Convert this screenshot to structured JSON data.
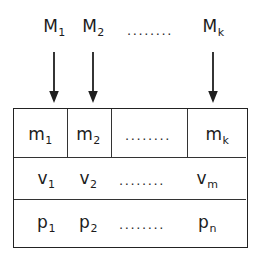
{
  "figure": {
    "type": "block-diagram",
    "background_color": "#ffffff",
    "line_color": "#222222",
    "text_color": "#1c1c1c",
    "ellipsis_text": "........"
  },
  "sources": {
    "items": [
      {
        "base": "M",
        "sub": "1",
        "x": 54
      },
      {
        "base": "M",
        "sub": "2",
        "x": 93
      },
      {
        "base": "M",
        "sub": "k",
        "x": 213
      }
    ],
    "ellipsis": {
      "text": "........",
      "x": 150
    }
  },
  "arrows": {
    "direction": "down",
    "items": [
      {
        "x": 54
      },
      {
        "x": 93
      },
      {
        "x": 213
      }
    ]
  },
  "table": {
    "rows": [
      {
        "name": "memory-row",
        "has_vertical_dividers": true,
        "cells": [
          {
            "base": "m",
            "sub": "1",
            "x": 40
          },
          {
            "base": "m",
            "sub": "2",
            "x": 88
          },
          {
            "base": "",
            "sub": "",
            "text": "........",
            "x": 148
          },
          {
            "base": "m",
            "sub": "k",
            "x": 217
          }
        ]
      },
      {
        "name": "value-row",
        "has_vertical_dividers": false,
        "cells": [
          {
            "base": "v",
            "sub": "1",
            "x": 46
          },
          {
            "base": "v",
            "sub": "2",
            "x": 88
          },
          {
            "base": "",
            "sub": "",
            "text": "........",
            "x": 142
          },
          {
            "base": "v",
            "sub": "m",
            "x": 207
          }
        ]
      },
      {
        "name": "parameter-row",
        "has_vertical_dividers": false,
        "cells": [
          {
            "base": "p",
            "sub": "1",
            "x": 46
          },
          {
            "base": "p",
            "sub": "2",
            "x": 88
          },
          {
            "base": "",
            "sub": "",
            "text": "........",
            "x": 142
          },
          {
            "base": "p",
            "sub": "n",
            "x": 207
          }
        ]
      }
    ]
  }
}
